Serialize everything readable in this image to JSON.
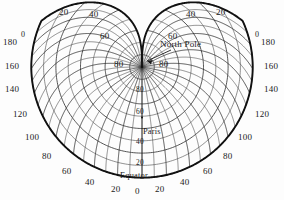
{
  "figure": {
    "projection_type": "werner-cordiform",
    "center_meridian_label": "Paris",
    "pole_label": "North Pole",
    "equator_label": "Equator",
    "colors": {
      "background": "#fdfdfd",
      "outline": "#111111",
      "graticule": "#4a4a4a",
      "text": "#1a1a1a"
    }
  },
  "chart_data": {
    "type": "line",
    "xlabel": "Longitude (degrees from Paris)",
    "ylabel": "Latitude (degrees)",
    "grid": true,
    "legend": false,
    "projection": "werner",
    "central_meridian": 0,
    "graticule_interval_deg": 10,
    "labeled_interval_deg": 20,
    "latitude_range": [
      0,
      90
    ],
    "longitude_range": [
      -180,
      180
    ],
    "annotations": [
      {
        "text": "North Pole",
        "points_to": "pole-cusp"
      },
      {
        "text": "Paris",
        "points_to": "central-meridian-lat-50"
      },
      {
        "text": "Equator",
        "points_to": "bottom-arc"
      }
    ],
    "labels": {
      "top": [
        "20",
        "40",
        "60",
        "40",
        "20"
      ],
      "left_side": [
        "0",
        "180",
        "160",
        "140",
        "120",
        "100"
      ],
      "right_side": [
        "0",
        "180",
        "160",
        "140",
        "120",
        "100"
      ],
      "lower_left_arc": [
        "80",
        "60",
        "40",
        "20"
      ],
      "lower_right_arc": [
        "80",
        "60",
        "40",
        "20"
      ],
      "bottom_center": "0",
      "central_meridian": [
        "80",
        "60",
        "40",
        "20"
      ],
      "pole_flank": [
        "80",
        "80"
      ]
    }
  },
  "labels": {
    "top_left_20": "20",
    "top_left_40": "40",
    "top_left_60": "60",
    "top_right_40": "40",
    "top_right_20": "20",
    "top_right_60": "60",
    "left_0": "0",
    "left_180": "180",
    "left_160": "160",
    "left_140": "140",
    "left_120": "120",
    "left_100": "100",
    "left_80": "80",
    "left_60": "60",
    "left_40": "40",
    "left_20": "20",
    "right_0": "0",
    "right_180": "180",
    "right_160": "160",
    "right_140": "140",
    "right_120": "120",
    "right_100": "100",
    "right_80": "80",
    "right_60": "60",
    "right_40": "40",
    "right_20": "20",
    "bottom_0": "0",
    "pole_left_80": "80",
    "pole_right_80": "80",
    "north_pole": "North Pole",
    "axis_80": "80",
    "axis_60": "60",
    "paris": "Paris",
    "axis_40": "40",
    "axis_20": "20",
    "equator": "Equator"
  }
}
